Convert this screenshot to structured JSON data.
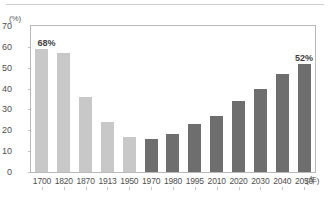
{
  "chart_data": {
    "type": "bar",
    "title": "",
    "subtitle": "",
    "xlabel": "年",
    "ylabel": "(%)",
    "ylim": [
      0,
      70
    ],
    "ytick_step": 10,
    "yticks": [
      "70",
      "60",
      "50",
      "40",
      "30",
      "20",
      "10",
      "0"
    ],
    "grid": false,
    "legend": "none",
    "categories": [
      "1700",
      "1820",
      "1870",
      "1913",
      "1950",
      "1970",
      "1980",
      "1995",
      "2010",
      "2020",
      "2030",
      "2040",
      "2050"
    ],
    "values": [
      59,
      57,
      36,
      24,
      17,
      16,
      18,
      23,
      27,
      34,
      40,
      47,
      52
    ],
    "bar_styles": [
      "light",
      "light",
      "light",
      "light",
      "light",
      "dark",
      "dark",
      "dark",
      "dark",
      "dark",
      "dark",
      "dark",
      "dark"
    ],
    "annotations": [
      {
        "category": "1700",
        "text": "68%"
      },
      {
        "category": "2050",
        "text": "52%"
      }
    ]
  },
  "axes": {
    "y_unit_label": "(%)",
    "x_unit_label": "(年)"
  },
  "colors": {
    "bar_light": "#c8c8c8",
    "bar_dark": "#6e6e6e",
    "frame": "#b9b9b9",
    "text": "#4f4f4f",
    "background": "#ffffff"
  }
}
